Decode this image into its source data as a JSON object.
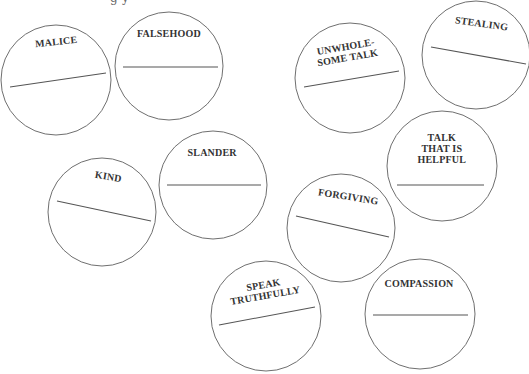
{
  "header": {
    "partial_text": "g y"
  },
  "colors": {
    "background": "#ffffff",
    "circle_stroke": "#6f6f6f",
    "line_stroke": "#555555",
    "label_text": "#333333"
  },
  "circles": [
    {
      "id": "malice",
      "label": "MALICE",
      "label_lines": [
        "MALICE"
      ],
      "cx": 56,
      "cy": 80,
      "r": 55,
      "label_pos": {
        "x": 56,
        "y": 42
      },
      "label_rotate": -6,
      "line": {
        "x1": 10,
        "y1": 87,
        "x2": 106,
        "y2": 73
      }
    },
    {
      "id": "falsehood",
      "label": "FALSEHOOD",
      "label_lines": [
        "FALSEHOOD"
      ],
      "cx": 169,
      "cy": 66,
      "r": 54,
      "label_pos": {
        "x": 169,
        "y": 34
      },
      "label_rotate": 0,
      "line": {
        "x1": 123,
        "y1": 67,
        "x2": 218,
        "y2": 67
      }
    },
    {
      "id": "unwholesome-talk",
      "label": "UNWHOLESOME TALK",
      "label_lines": [
        "UNWHOLE-",
        "SOME TALK"
      ],
      "cx": 350,
      "cy": 78,
      "r": 55,
      "label_pos": {
        "x": 346,
        "y": 47
      },
      "label_rotate": -10,
      "line": {
        "x1": 304,
        "y1": 87,
        "x2": 399,
        "y2": 71
      }
    },
    {
      "id": "stealing",
      "label": "STEALING",
      "label_lines": [
        "STEALING"
      ],
      "cx": 476,
      "cy": 55,
      "r": 54,
      "label_pos": {
        "x": 481,
        "y": 24
      },
      "label_rotate": 8,
      "line": {
        "x1": 431,
        "y1": 47,
        "x2": 526,
        "y2": 64
      }
    },
    {
      "id": "kind",
      "label": "KIND",
      "label_lines": [
        "KIND"
      ],
      "cx": 102,
      "cy": 212,
      "r": 54,
      "label_pos": {
        "x": 108,
        "y": 177
      },
      "label_rotate": 9,
      "line": {
        "x1": 57,
        "y1": 201,
        "x2": 151,
        "y2": 221
      }
    },
    {
      "id": "slander",
      "label": "SLANDER",
      "label_lines": [
        "SLANDER"
      ],
      "cx": 213,
      "cy": 185,
      "r": 54,
      "label_pos": {
        "x": 212,
        "y": 153
      },
      "label_rotate": 0,
      "line": {
        "x1": 167,
        "y1": 185,
        "x2": 261,
        "y2": 185
      }
    },
    {
      "id": "talk-that-is-helpful",
      "label": "TALK THAT IS HELPFUL",
      "label_lines": [
        "TALK",
        "THAT IS",
        "HELPFUL"
      ],
      "cx": 442,
      "cy": 166,
      "r": 55,
      "label_pos": {
        "x": 442,
        "y": 138
      },
      "label_rotate": 0,
      "line": {
        "x1": 397,
        "y1": 185,
        "x2": 484,
        "y2": 185
      }
    },
    {
      "id": "forgiving",
      "label": "FORGIVING",
      "label_lines": [
        "FORGIVING"
      ],
      "cx": 341,
      "cy": 228,
      "r": 54,
      "label_pos": {
        "x": 348,
        "y": 197
      },
      "label_rotate": 9,
      "line": {
        "x1": 296,
        "y1": 216,
        "x2": 389,
        "y2": 237
      }
    },
    {
      "id": "speak-truthfully",
      "label": "SPEAK TRUTHFULLY",
      "label_lines": [
        "SPEAK",
        "TRUTHFULLY"
      ],
      "cx": 266,
      "cy": 316,
      "r": 55,
      "label_pos": {
        "x": 264,
        "y": 285
      },
      "label_rotate": -10,
      "line": {
        "x1": 219,
        "y1": 325,
        "x2": 315,
        "y2": 307
      }
    },
    {
      "id": "compassion",
      "label": "COMPASSION",
      "label_lines": [
        "COMPASSION"
      ],
      "cx": 420,
      "cy": 314,
      "r": 55,
      "label_pos": {
        "x": 419,
        "y": 284
      },
      "label_rotate": 0,
      "line": {
        "x1": 373,
        "y1": 315,
        "x2": 468,
        "y2": 315
      }
    }
  ]
}
